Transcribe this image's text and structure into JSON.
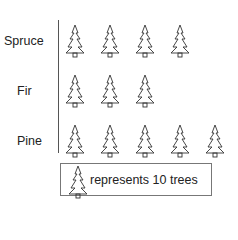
{
  "chart_data": {
    "type": "pictograph",
    "title": "",
    "categories": [
      "Spruce",
      "Fir",
      "Pine"
    ],
    "icon_counts": [
      4,
      3,
      5
    ],
    "values": [
      40,
      30,
      50
    ],
    "unit_value": 10,
    "icon": "tree-icon",
    "legend": "represents 10 trees"
  },
  "rows": [
    {
      "label": "Spruce",
      "count": 4
    },
    {
      "label": "Fir",
      "count": 3
    },
    {
      "label": "Pine",
      "count": 5
    }
  ],
  "legend": {
    "text": "represents 10 trees"
  }
}
